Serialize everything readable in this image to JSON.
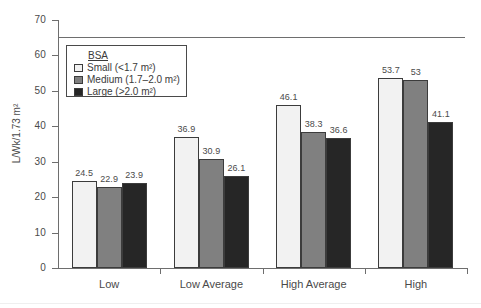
{
  "chart_data": {
    "type": "bar",
    "title": "",
    "xlabel": "",
    "ylabel": "L/Wk/1.73 m²",
    "ylim": [
      0,
      70
    ],
    "ytick_step": 10,
    "yticks": [
      0,
      10,
      20,
      30,
      40,
      50,
      60,
      70
    ],
    "grid": false,
    "legend_position": "upper-left-inside",
    "categories": [
      "Low",
      "Low Average",
      "High Average",
      "High"
    ],
    "series": [
      {
        "name": "Small (<1.7 m²)",
        "values": [
          24.5,
          36.9,
          46.1,
          53.7
        ]
      },
      {
        "name": "Medium (1.7–2.0 m²)",
        "values": [
          22.9,
          30.9,
          38.3,
          53.0
        ]
      },
      {
        "name": "Large (>2.0 m²)",
        "values": [
          23.9,
          26.1,
          36.6,
          41.1
        ]
      }
    ],
    "value_labels": [
      [
        "24.5",
        "22.9",
        "23.9"
      ],
      [
        "36.9",
        "30.9",
        "26.1"
      ],
      [
        "46.1",
        "38.3",
        "36.6"
      ],
      [
        "53.7",
        "53",
        "41.1"
      ]
    ],
    "annotations": [
      {
        "name": "reference-line",
        "type": "hline",
        "y": 65
      }
    ]
  },
  "axes": {
    "y_title": "L/Wk/1.73 m²",
    "y_tick_labels": [
      "70",
      "60",
      "50",
      "40",
      "30",
      "20",
      "10",
      "0"
    ],
    "x_tick_labels": [
      "Low",
      "Low Average",
      "High Average",
      "High"
    ]
  },
  "legend": {
    "title": "BSA",
    "entries": [
      {
        "label": "Small (<1.7 m²)",
        "color": "#f2f2f2"
      },
      {
        "label": "Medium (1.7–2.0 m²)",
        "color": "#808080"
      },
      {
        "label": "Large (>2.0 m²)",
        "color": "#262626"
      }
    ]
  },
  "colors": {
    "small": "#f2f2f2",
    "medium": "#808080",
    "large": "#262626",
    "axis": "#6e6e6e",
    "bar_border": "#3c3c3c",
    "text": "#4a4a4a",
    "background": "#ffffff"
  }
}
